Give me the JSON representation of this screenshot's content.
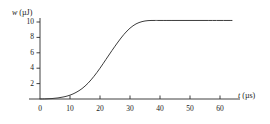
{
  "chart_data": {
    "type": "line",
    "title": "",
    "subtitle": "",
    "xlabel": "t (µs)",
    "ylabel": "w (µJ)",
    "xlabel_var": "t",
    "xlabel_unit": "(µs)",
    "ylabel_var": "w",
    "ylabel_unit": "(µJ)",
    "xlim": [
      0,
      66
    ],
    "ylim": [
      0,
      11.2
    ],
    "grid": false,
    "legend": null,
    "legend_position": "none",
    "xticks": [
      0,
      10,
      20,
      30,
      40,
      50,
      60
    ],
    "xtick_labels": [
      "0",
      "10",
      "20",
      "30",
      "40",
      "50",
      "60"
    ],
    "yticks": [
      2,
      4,
      6,
      8,
      10
    ],
    "ytick_labels": [
      "2",
      "4",
      "6",
      "8",
      "10"
    ],
    "line_color": "#3c3c3c",
    "line_width": 1.0,
    "axis_color": "#2b2b2b",
    "series": [
      {
        "name": "w(t)",
        "x": [
          0,
          2,
          4,
          6,
          8,
          10,
          12,
          14,
          16,
          18,
          20,
          22,
          24,
          26,
          28,
          30,
          32,
          34,
          36,
          38,
          40,
          45,
          50,
          55,
          60,
          64
        ],
        "values": [
          0.0,
          0.02,
          0.06,
          0.14,
          0.28,
          0.5,
          0.85,
          1.35,
          2.05,
          2.95,
          4.0,
          5.15,
          6.3,
          7.4,
          8.4,
          9.2,
          9.75,
          10.05,
          10.18,
          10.2,
          10.2,
          10.2,
          10.2,
          10.2,
          10.2,
          10.2
        ]
      }
    ],
    "annotations": [],
    "plateau_value": 10.2,
    "inflection_x": 24
  },
  "figure": {
    "caption": "",
    "background": "#ffffff"
  }
}
